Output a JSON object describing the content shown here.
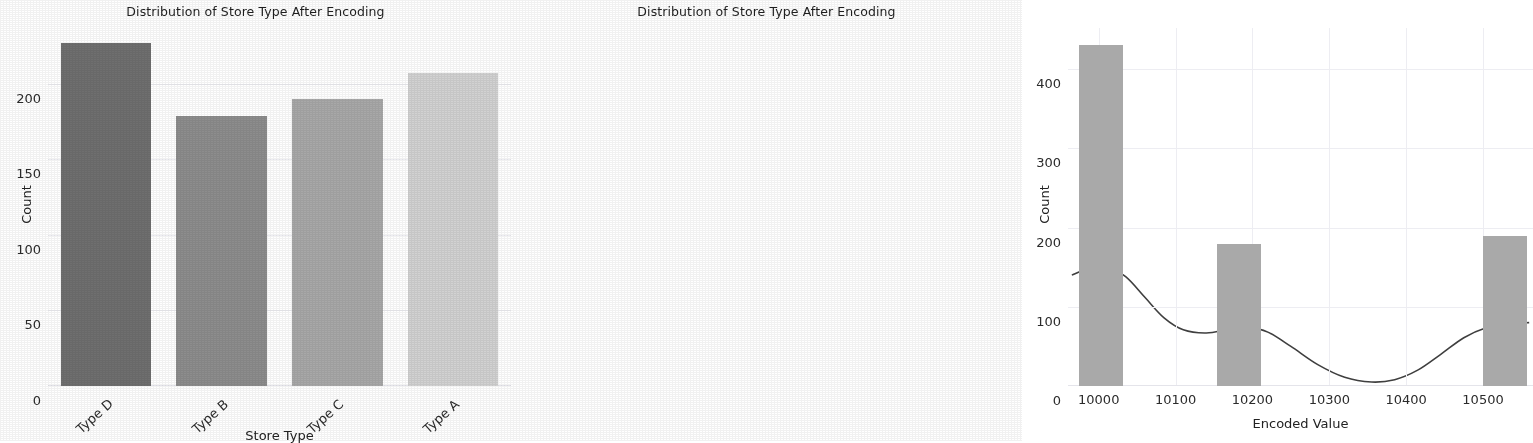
{
  "figure": {
    "background": "#ffffff",
    "panels": [
      "bar-panel",
      "histogram-panel"
    ]
  },
  "left_panel": {
    "title": "Distribution of Store Type After Encoding",
    "xlabel": "Store Type",
    "ylabel": "Count"
  },
  "right_panel": {
    "title": "Distribution of Store Type After Encoding",
    "xlabel": "Encoded Value",
    "ylabel": "Count"
  },
  "chart_data": [
    {
      "type": "bar",
      "title": "Distribution of Store Type After Encoding",
      "xlabel": "Store Type",
      "ylabel": "Count",
      "categories": [
        "Type D",
        "Type B",
        "Type C",
        "Type A"
      ],
      "values": [
        227,
        179,
        190,
        207
      ],
      "colors": [
        "#6f6f6f",
        "#8d8d8d",
        "#a8a8a8",
        "#d2d2d2"
      ],
      "ylim": [
        0,
        237
      ],
      "yticks": [
        0,
        50,
        100,
        150,
        200
      ],
      "ytick_labels": [
        "0",
        "50",
        "100",
        "150",
        "200"
      ],
      "xtick_labels": [
        "Type D",
        "Type B",
        "Type C",
        "Type A"
      ],
      "xtick_rotation": -42,
      "grid": true,
      "legend": "none"
    },
    {
      "type": "histogram",
      "title": "Distribution of Store Type After Encoding",
      "xlabel": "Encoded Value",
      "ylabel": "Count",
      "bars": [
        {
          "center": 10003,
          "value": 430
        },
        {
          "center": 10182,
          "value": 179
        },
        {
          "center": 10528,
          "value": 190
        }
      ],
      "xlim": [
        9960,
        10565
      ],
      "ylim": [
        0,
        452
      ],
      "xticks": [
        10000,
        10100,
        10200,
        10300,
        10400,
        10500
      ],
      "xtick_labels": [
        "10000",
        "10100",
        "10200",
        "10300",
        "10400",
        "10500"
      ],
      "yticks": [
        0,
        100,
        200,
        300,
        400
      ],
      "ytick_labels": [
        "0",
        "100",
        "200",
        "300",
        "400"
      ],
      "bar_color": "#a9a9a9",
      "kde_color": "#3f3f3f",
      "kde_curve": [
        {
          "x": 9965,
          "y": 140
        },
        {
          "x": 9990,
          "y": 150
        },
        {
          "x": 10010,
          "y": 151
        },
        {
          "x": 10035,
          "y": 138
        },
        {
          "x": 10060,
          "y": 112
        },
        {
          "x": 10085,
          "y": 86
        },
        {
          "x": 10110,
          "y": 71
        },
        {
          "x": 10140,
          "y": 67
        },
        {
          "x": 10170,
          "y": 72
        },
        {
          "x": 10195,
          "y": 74
        },
        {
          "x": 10220,
          "y": 68
        },
        {
          "x": 10250,
          "y": 50
        },
        {
          "x": 10285,
          "y": 27
        },
        {
          "x": 10320,
          "y": 11
        },
        {
          "x": 10355,
          "y": 5
        },
        {
          "x": 10385,
          "y": 8
        },
        {
          "x": 10415,
          "y": 20
        },
        {
          "x": 10445,
          "y": 40
        },
        {
          "x": 10475,
          "y": 61
        },
        {
          "x": 10505,
          "y": 74
        },
        {
          "x": 10535,
          "y": 79
        },
        {
          "x": 10560,
          "y": 80
        }
      ],
      "grid": true,
      "legend": "none"
    }
  ]
}
